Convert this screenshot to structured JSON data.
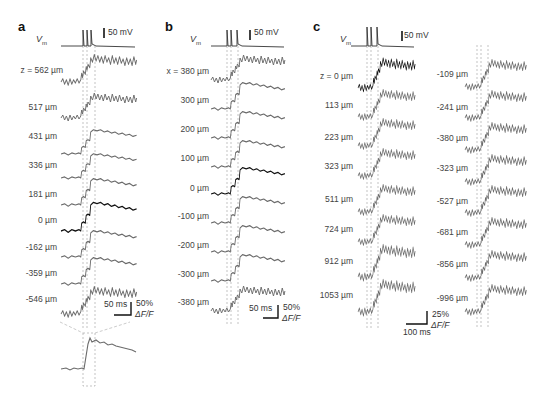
{
  "figure": {
    "panels": [
      {
        "letter": "a",
        "vm_label": "V",
        "vm_sub": "m",
        "vm_scale": "50 mV",
        "trace_labels": [
          "z = 562 µm",
          "517 µm",
          "431 µm",
          "336 µm",
          "181 µm",
          "0 µm",
          "-162 µm",
          "-359 µm",
          "-546 µm"
        ],
        "highlight_index": 5,
        "time_scale": "50 ms",
        "dff_scale": "50%",
        "dff_label": "ΔF/F",
        "has_inset": true
      },
      {
        "letter": "b",
        "vm_label": "V",
        "vm_sub": "m",
        "vm_scale": "50 mV",
        "trace_labels": [
          "x = 380 µm",
          "300 µm",
          "200 µm",
          "100 µm",
          "0 µm",
          "-100 µm",
          "-200 µm",
          "-300 µm",
          "-380 µm"
        ],
        "highlight_index": 4,
        "time_scale": "50 ms",
        "dff_scale": "50%",
        "dff_label": "ΔF/F"
      },
      {
        "letter": "c",
        "vm_label": "V",
        "vm_sub": "m",
        "vm_scale": "50 mV",
        "trace_labels_left": [
          "z = 0 µm",
          "113 µm",
          "223 µm",
          "323 µm",
          "511 µm",
          "724 µm",
          "912 µm",
          "1053 µm"
        ],
        "trace_labels_right": [
          "-109 µm",
          "-241 µm",
          "-380 µm",
          "-323 µm",
          "-527 µm",
          "-681 µm",
          "-856 µm",
          "-996 µm"
        ],
        "highlight_index": 0,
        "time_scale": "100 ms",
        "dff_scale": "25%",
        "dff_label": "ΔF/F"
      }
    ],
    "colors": {
      "trace": "#6b6b6b",
      "highlight_trace": "#111111",
      "guide_lines": "#9a9a9a"
    }
  }
}
